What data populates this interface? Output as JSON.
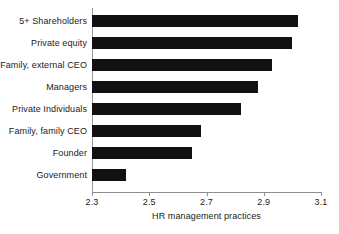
{
  "chart_data": {
    "type": "bar",
    "orientation": "horizontal",
    "title": "",
    "xlabel": "HR management practices",
    "ylabel": "",
    "xlim": [
      2.3,
      3.1
    ],
    "xticks": [
      "2.3",
      "2.5",
      "2.7",
      "2.9",
      "3.1"
    ],
    "xtick_values": [
      2.3,
      2.5,
      2.7,
      2.9,
      3.1
    ],
    "grid": false,
    "legend": null,
    "bar_color": "#111111",
    "background_color": "#ffffff",
    "axis_color": "#8e8e8e",
    "categories": [
      "5+ Shareholders",
      "Private equity",
      "Family, external CEO",
      "Managers",
      "Private Individuals",
      "Family, family CEO",
      "Founder",
      "Government"
    ],
    "values": [
      3.02,
      3.0,
      2.93,
      2.88,
      2.82,
      2.68,
      2.65,
      2.42
    ]
  }
}
